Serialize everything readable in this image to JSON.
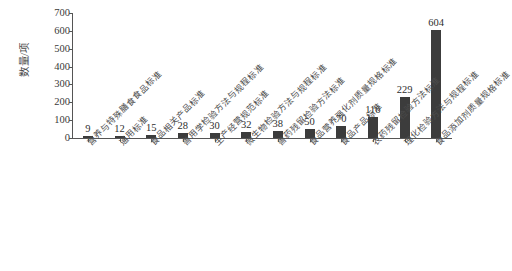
{
  "chart_data": {
    "type": "bar",
    "title": "",
    "xlabel": "",
    "ylabel": "数量/项",
    "ylim": [
      0,
      700
    ],
    "y_ticks": [
      0,
      100,
      200,
      300,
      400,
      500,
      600,
      700
    ],
    "grid": false,
    "legend": false,
    "bar_color": "#3c3c3c",
    "categories": [
      "营养与特殊膳食食品标准",
      "通用标准",
      "食品相关产品标准",
      "兽用学检验方法与规程标准",
      "生产经营规范标准",
      "微生物检验方法与规程标准",
      "兽药残留检验方法标准",
      "食品营养强化剂质量规格标准",
      "食品产品标准",
      "农药残留检验方法标准",
      "理化检验方法与规程标准",
      "食品添加剂质量规格标准"
    ],
    "values": [
      9,
      12,
      15,
      28,
      30,
      32,
      38,
      50,
      70,
      116,
      229,
      604
    ],
    "value_labels": [
      "9",
      "12",
      "15",
      "28",
      "30",
      "32",
      "38",
      "50",
      "70",
      "116",
      "229",
      "604"
    ]
  }
}
